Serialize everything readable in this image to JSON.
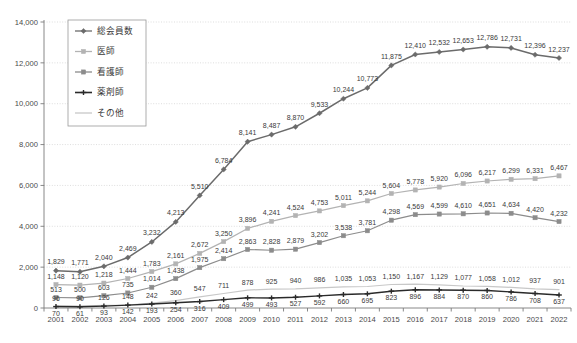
{
  "chart_data": {
    "type": "line",
    "title": "",
    "xlabel": "",
    "ylabel": "",
    "ylim": [
      0,
      14000
    ],
    "ytick_step": 2000,
    "ytick_labels": [
      "0",
      "2,000",
      "4,000",
      "6,000",
      "8,000",
      "10,000",
      "12,000",
      "14,000"
    ],
    "ytick_values": [
      0,
      2000,
      4000,
      6000,
      8000,
      10000,
      12000,
      14000
    ],
    "grid": true,
    "grid_axis": "y",
    "legend_position": "top-left",
    "categories": [
      "2001",
      "2002",
      "2003",
      "2004",
      "2005",
      "2006",
      "2007",
      "2008",
      "2009",
      "2010",
      "2011",
      "2012",
      "2013",
      "2014",
      "2015",
      "2016",
      "2017",
      "2018",
      "2019",
      "2020",
      "2021",
      "2022"
    ],
    "series": [
      {
        "name": "総会員数",
        "color": "#6b6b6b",
        "marker": "diamond",
        "label_color": "#3a3a3a",
        "values": [
          1829,
          1771,
          2040,
          2469,
          3232,
          4213,
          5510,
          6784,
          8141,
          8487,
          8870,
          9533,
          10244,
          10773,
          11875,
          12410,
          12532,
          12653,
          12786,
          12731,
          12396,
          12237
        ],
        "value_labels": [
          "1,829",
          "1,771",
          "2,040",
          "2,469",
          "3,232",
          "4,213",
          "5,510",
          "6,784",
          "8,141",
          "8,487",
          "8,870",
          "9,533",
          "10,244",
          "10,773",
          "11,875",
          "12,410",
          "12,532",
          "12,653",
          "12,786",
          "12,731",
          "12,396",
          "12,237"
        ]
      },
      {
        "name": "医師",
        "color": "#b3b3b3",
        "marker": "square",
        "label_color": "#3a3a3a",
        "values": [
          1148,
          1120,
          1218,
          1444,
          1783,
          2161,
          2672,
          3250,
          3896,
          4241,
          4524,
          4753,
          5011,
          5244,
          5604,
          5778,
          5920,
          6096,
          6217,
          6299,
          6331,
          6467
        ],
        "value_labels": [
          "1,148",
          "1,120",
          "1,218",
          "1,444",
          "1,783",
          "2,161",
          "2,672",
          "3,250",
          "3,896",
          "4,241",
          "4,524",
          "4,753",
          "5,011",
          "5,244",
          "5,604",
          "5,778",
          "5,920",
          "6,096",
          "6,217",
          "6,299",
          "6,331",
          "6,467"
        ]
      },
      {
        "name": "看護師",
        "color": "#8c8c8c",
        "marker": "square",
        "label_color": "#3a3a3a",
        "values": [
          513,
          500,
          603,
          735,
          1014,
          1438,
          1975,
          2414,
          2863,
          2828,
          2879,
          3202,
          3538,
          3781,
          4298,
          4569,
          4599,
          4610,
          4651,
          4634,
          4420,
          4232
        ],
        "value_labels": [
          "513",
          "500",
          "603",
          "735",
          "1,014",
          "1,438",
          "1,975",
          "2,414",
          "2,863",
          "2,828",
          "2,879",
          "3,202",
          "3,538",
          "3,781",
          "4,298",
          "4,569",
          "4,599",
          "4,610",
          "4,651",
          "4,634",
          "4,420",
          "4,232"
        ]
      },
      {
        "name": "薬剤師",
        "color": "#2a2a2a",
        "marker": "plus",
        "label_color": "#3a3a3a",
        "values": [
          70,
          61,
          93,
          142,
          193,
          254,
          316,
          409,
          499,
          493,
          527,
          592,
          660,
          695,
          823,
          896,
          884,
          870,
          860,
          786,
          708,
          637
        ],
        "value_labels": [
          "70",
          "61",
          "93",
          "142",
          "193",
          "254",
          "316",
          "409",
          "499",
          "493",
          "527",
          "592",
          "660",
          "695",
          "823",
          "896",
          "884",
          "870",
          "860",
          "786",
          "708",
          "637"
        ]
      },
      {
        "name": "その他",
        "color": "#c8c8c8",
        "marker": "none",
        "label_color": "#3a3a3a",
        "values": [
          96,
          90,
          126,
          148,
          242,
          360,
          547,
          711,
          878,
          925,
          940,
          986,
          1035,
          1053,
          1150,
          1167,
          1129,
          1077,
          1058,
          1012,
          937,
          901
        ],
        "value_labels": [
          "96",
          "90",
          "126",
          "148",
          "242",
          "360",
          "547",
          "711",
          "878",
          "925",
          "940",
          "986",
          "1,035",
          "1,053",
          "1,150",
          "1,167",
          "1,129",
          "1,077",
          "1,058",
          "1,012",
          "937",
          "901"
        ]
      }
    ]
  }
}
